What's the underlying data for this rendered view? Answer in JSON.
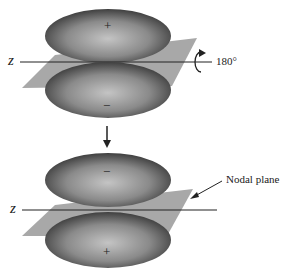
{
  "diagram": {
    "top": {
      "axis_label": "z",
      "upper_lobe_sign": "+",
      "lower_lobe_sign": "−",
      "rotation_label": "180°"
    },
    "bottom": {
      "axis_label": "z",
      "upper_lobe_sign": "−",
      "lower_lobe_sign": "+",
      "plane_label": "Nodal plane"
    },
    "colors": {
      "plane": "#a8a8a8",
      "lobe_dark": "#3a3a3a",
      "lobe_light": "#b8b8b8",
      "line": "#222222"
    }
  }
}
